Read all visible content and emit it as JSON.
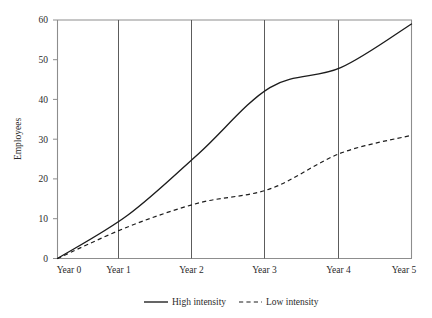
{
  "chart_data": {
    "type": "line",
    "title": "",
    "subtitle": "",
    "xlabel": "",
    "ylabel": "Employees",
    "x": [
      0,
      1,
      2,
      3,
      4,
      5
    ],
    "categories": [
      "Year 0",
      "Year 1",
      "Year 2",
      "Year 3",
      "Year 4",
      "Year 5"
    ],
    "series": [
      {
        "name": "High intensity",
        "style": "solid",
        "color": "#1c1c1c",
        "values": [
          0,
          11,
          26.5,
          43,
          48,
          59
        ]
      },
      {
        "name": "Low intensity",
        "style": "dashed",
        "color": "#1c1c1c",
        "values": [
          0,
          8,
          14,
          17.5,
          26.5,
          31
        ]
      }
    ],
    "xlim": [
      0,
      5
    ],
    "ylim": [
      0,
      60
    ],
    "yticks": [
      0,
      10,
      20,
      30,
      40,
      50,
      60
    ],
    "ytick_labels": [
      "0",
      "10",
      "20",
      "30",
      "40",
      "50",
      "60"
    ],
    "xtick_labels": [
      "Year 0",
      "Year 1",
      "Year 2",
      "Year 3",
      "Year 4",
      "Year 5"
    ],
    "grid": "vertical-only",
    "legend_position": "bottom-center",
    "legend_entries": [
      "High intensity",
      "Low intensity"
    ]
  },
  "axes": {
    "y_title": "Employees",
    "y_tick_0": "0",
    "y_tick_1": "10",
    "y_tick_2": "20",
    "y_tick_3": "30",
    "y_tick_4": "40",
    "y_tick_5": "50",
    "y_tick_6": "60",
    "x_tick_0": "Year 0",
    "x_tick_1": "Year 1",
    "x_tick_2": "Year 2",
    "x_tick_3": "Year 3",
    "x_tick_4": "Year 4",
    "x_tick_5": "Year 5"
  },
  "legend": {
    "high_label": "High intensity",
    "low_label": "Low intensity"
  },
  "colors": {
    "series_line": "#1c1c1c",
    "axis": "#8d8d8d",
    "grid": "#5c5c5c",
    "text": "#2b2b2b",
    "background": "#ffffff"
  }
}
